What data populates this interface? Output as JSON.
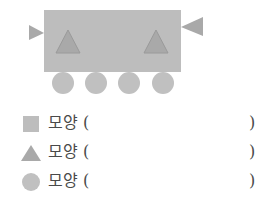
{
  "figure": {
    "colors": {
      "rectangle": "#bdbdbd",
      "triangle": "#a9a9a9",
      "triangle_stroke": "#9a9a9a",
      "circle": "#c0c0c0"
    },
    "counts_visible": {
      "rectangles": 1,
      "triangles": 4,
      "circles": 4
    }
  },
  "questions": [
    {
      "shape": "square",
      "label": "모양 (",
      "close": ")"
    },
    {
      "shape": "triangle",
      "label": "모양 (",
      "close": ")"
    },
    {
      "shape": "circle",
      "label": "모양 (",
      "close": ")"
    }
  ]
}
